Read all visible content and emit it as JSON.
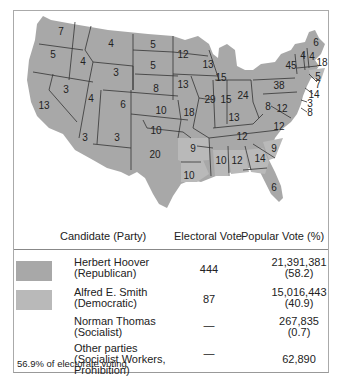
{
  "map": {
    "colors": {
      "republican": "#a8a8a8",
      "democratic": "#b9b9b9",
      "border": "#333333"
    },
    "state_labels": [
      {
        "v": "7",
        "x": 48,
        "y": 22
      },
      {
        "v": "5",
        "x": 40,
        "y": 45
      },
      {
        "v": "4",
        "x": 98,
        "y": 34
      },
      {
        "v": "4",
        "x": 70,
        "y": 52
      },
      {
        "v": "5",
        "x": 140,
        "y": 35
      },
      {
        "v": "5",
        "x": 140,
        "y": 56
      },
      {
        "v": "3",
        "x": 103,
        "y": 63
      },
      {
        "v": "13",
        "x": 31,
        "y": 96
      },
      {
        "v": "3",
        "x": 53,
        "y": 80
      },
      {
        "v": "4",
        "x": 78,
        "y": 89
      },
      {
        "v": "6",
        "x": 110,
        "y": 95
      },
      {
        "v": "8",
        "x": 143,
        "y": 79
      },
      {
        "v": "10",
        "x": 148,
        "y": 101
      },
      {
        "v": "3",
        "x": 72,
        "y": 128
      },
      {
        "v": "3",
        "x": 104,
        "y": 128
      },
      {
        "v": "10",
        "x": 143,
        "y": 121
      },
      {
        "v": "20",
        "x": 142,
        "y": 145
      },
      {
        "v": "12",
        "x": 170,
        "y": 45
      },
      {
        "v": "13",
        "x": 170,
        "y": 75
      },
      {
        "v": "18",
        "x": 176,
        "y": 103
      },
      {
        "v": "9",
        "x": 180,
        "y": 139
      },
      {
        "v": "10",
        "x": 176,
        "y": 166
      },
      {
        "v": "13",
        "x": 195,
        "y": 55
      },
      {
        "v": "29",
        "x": 197,
        "y": 90
      },
      {
        "v": "15",
        "x": 208,
        "y": 68
      },
      {
        "v": "15",
        "x": 213,
        "y": 90
      },
      {
        "v": "24",
        "x": 230,
        "y": 86
      },
      {
        "v": "13",
        "x": 221,
        "y": 108
      },
      {
        "v": "12",
        "x": 229,
        "y": 127
      },
      {
        "v": "10",
        "x": 208,
        "y": 151
      },
      {
        "v": "12",
        "x": 224,
        "y": 151
      },
      {
        "v": "14",
        "x": 247,
        "y": 149
      },
      {
        "v": "9",
        "x": 261,
        "y": 139
      },
      {
        "v": "6",
        "x": 261,
        "y": 178
      },
      {
        "v": "38",
        "x": 266,
        "y": 76
      },
      {
        "v": "8",
        "x": 255,
        "y": 97
      },
      {
        "v": "12",
        "x": 269,
        "y": 99
      },
      {
        "v": "12",
        "x": 266,
        "y": 117
      },
      {
        "v": "45",
        "x": 278,
        "y": 56
      },
      {
        "v": "4",
        "x": 290,
        "y": 46
      },
      {
        "v": "4",
        "x": 299,
        "y": 47
      },
      {
        "v": "6",
        "x": 303,
        "y": 33
      },
      {
        "v": "18",
        "x": 309,
        "y": 53
      },
      {
        "v": "5",
        "x": 305,
        "y": 67
      },
      {
        "v": "7",
        "x": 305,
        "y": 75
      },
      {
        "v": "14",
        "x": 301,
        "y": 85
      },
      {
        "v": "3",
        "x": 297,
        "y": 94
      },
      {
        "v": "8",
        "x": 297,
        "y": 103
      }
    ]
  },
  "table": {
    "headers": {
      "candidate": "Candidate (Party)",
      "electoral": "Electoral Vote",
      "popular": "Popular Vote (%)"
    },
    "rows": [
      {
        "name": "Herbert Hoover",
        "party": "(Republican)",
        "electoral": "444",
        "popular": "21,391,381",
        "percent": "(58.2)",
        "swatch": "#a8a8a8"
      },
      {
        "name": "Alfred E. Smith",
        "party": "(Democratic)",
        "electoral": "87",
        "popular": "15,016,443",
        "percent": "(40.9)",
        "swatch": "#b9b9b9"
      },
      {
        "name": "Norman Thomas",
        "party": "(Socialist)",
        "electoral": "—",
        "popular": "267,835",
        "percent": "(0.7)"
      },
      {
        "name": "Other parties",
        "party": "(Socialist Workers,",
        "party2": "Prohibition)",
        "electoral": "—",
        "popular": "62,890"
      }
    ],
    "footnote": "56.9% of electorate voting"
  }
}
